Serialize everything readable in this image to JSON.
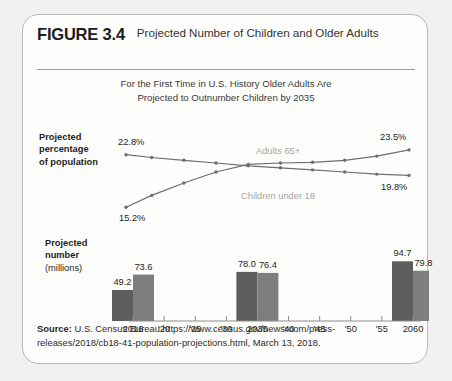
{
  "figure": {
    "number": "FIGURE 3.4",
    "title": "Projected Number of Children and Older Adults",
    "subtitle_line1": "For the First Time in U.S. History Older Adults Are",
    "subtitle_line2": "Projected to Outnumber Children by 2035",
    "source_label": "Source:",
    "source_text": " U.S. Census Bureau https://www.census.gov/newsroom/press-releases/2018/cb18-41-population-projections.html, March 13, 2018."
  },
  "line_axis": {
    "label_line1": "Projected",
    "label_line2": "percentage",
    "label_line3": "of population"
  },
  "bar_axis": {
    "label_line1": "Projected",
    "label_line2": "number",
    "label_line3": "(millions)"
  },
  "colors": {
    "line_dark": "#6e6e6e",
    "bar_dark": "#5d5d5d",
    "bar_light": "#7e7e7e",
    "series_label": "#a7a6a2",
    "card_border": "#b9b9b9",
    "page_background": "#f2f1ef",
    "card_background": "#fdfdfc",
    "text": "#1d1d1d"
  },
  "chart_data": [
    {
      "type": "line",
      "title": "Projected percentage of population",
      "xlabel": "",
      "ylabel": "Projected percentage of population",
      "x": [
        2016,
        2020,
        2025,
        2030,
        2035,
        2040,
        2045,
        2050,
        2055,
        2060
      ],
      "xlim": [
        2016,
        2060
      ],
      "ylim": [
        14.5,
        24.5
      ],
      "grid": false,
      "legend": "inline",
      "series": [
        {
          "name": "Children under 18",
          "inline_label": "Children under 18",
          "values": [
            22.8,
            22.4,
            22.0,
            21.6,
            21.2,
            20.9,
            20.6,
            20.3,
            20.0,
            19.8
          ],
          "endpoint_labels": {
            "start": "22.8%",
            "end": "19.8%"
          }
        },
        {
          "name": "Adults 65+",
          "inline_label": "Adults 65+",
          "values": [
            15.2,
            16.9,
            18.7,
            20.3,
            21.4,
            21.6,
            21.7,
            22.0,
            22.6,
            23.5
          ],
          "endpoint_labels": {
            "start": "15.2%",
            "end": "23.5%"
          }
        }
      ]
    },
    {
      "type": "bar",
      "title": "Projected number (millions)",
      "xlabel": "",
      "ylabel": "Projected number (millions)",
      "categories": [
        "2016",
        "'20",
        "'25",
        "'30",
        "2035",
        "'40",
        "'45",
        "'50",
        "'55",
        "2060"
      ],
      "ylim": [
        0,
        100
      ],
      "grid": false,
      "groups": [
        {
          "category": "2016",
          "values": [
            49.2,
            73.6
          ],
          "labels": [
            "49.2",
            "73.6"
          ]
        },
        {
          "category": "2035",
          "values": [
            78.0,
            76.4
          ],
          "labels": [
            "78.0",
            "76.4"
          ]
        },
        {
          "category": "2060",
          "values": [
            94.7,
            79.8
          ],
          "labels": [
            "94.7",
            "79.8"
          ]
        }
      ],
      "series": [
        {
          "name": "Adults 65+",
          "values": [
            49.2,
            null,
            null,
            null,
            78.0,
            null,
            null,
            null,
            null,
            94.7
          ]
        },
        {
          "name": "Children under 18",
          "values": [
            73.6,
            null,
            null,
            null,
            76.4,
            null,
            null,
            null,
            null,
            79.8
          ]
        }
      ]
    }
  ]
}
